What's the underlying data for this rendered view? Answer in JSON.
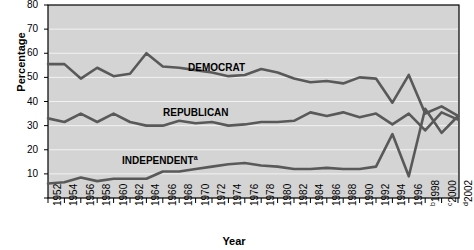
{
  "chart_data": {
    "type": "line",
    "title": "",
    "xlabel": "Year",
    "ylabel": "Percentage",
    "ylim": [
      0,
      80
    ],
    "yticks": [
      0,
      10,
      20,
      30,
      40,
      50,
      60,
      70,
      80
    ],
    "ytick_labels": [
      "",
      "10",
      "20",
      "30",
      "40",
      "50",
      "60",
      "70",
      "80"
    ],
    "grid": "horizontal",
    "legend": "inline-labels",
    "plot_bg": "#d4d4d4",
    "line_color": "#595959",
    "frame_color": "#000000",
    "categories": [
      1952,
      1954,
      1956,
      1958,
      1960,
      1962,
      1964,
      1966,
      1968,
      1970,
      1972,
      1974,
      1976,
      1978,
      1980,
      1982,
      1984,
      1986,
      1988,
      1990,
      1992,
      1994,
      1996,
      1998,
      2000,
      2002
    ],
    "xtick_labels": [
      "1952",
      "1954",
      "1956",
      "1958",
      "1960",
      "1962",
      "1964",
      "1966",
      "1968",
      "1970",
      "1972",
      "1974",
      "1976",
      "1978",
      "1980",
      "1982",
      "1984",
      "1986",
      "1988",
      "1990",
      "1992",
      "1994",
      "1996",
      "1998",
      "2000",
      "2002"
    ],
    "xtick_superscripts": [
      "",
      "",
      "",
      "",
      "",
      "",
      "",
      "",
      "",
      "",
      "",
      "",
      "",
      "",
      "",
      "",
      "",
      "",
      "",
      "",
      "",
      "",
      "",
      "b",
      "c",
      "d"
    ],
    "series": [
      {
        "name": "DEMOCRAT",
        "label": "DEMOCRAT",
        "label_superscript": "",
        "values": [
          55.5,
          55.5,
          49.5,
          54,
          50.5,
          51.5,
          60,
          54.5,
          54,
          53,
          52,
          50.5,
          51,
          53.5,
          52,
          49.5,
          48,
          48.5,
          47.5,
          50,
          49.5,
          39.5,
          51,
          35,
          38,
          34
        ]
      },
      {
        "name": "REPUBLICAN",
        "label": "REPUBLICAN",
        "label_superscript": "",
        "values": [
          33,
          31.5,
          35,
          31.5,
          35,
          31.5,
          30,
          30,
          32,
          31,
          31.5,
          30,
          30.5,
          31.5,
          31.5,
          32,
          35.5,
          34,
          35.5,
          33.5,
          35,
          30.5,
          35,
          28,
          35.5,
          32.5
        ]
      },
      {
        "name": "INDEPENDENT",
        "label": "INDEPENDENT",
        "label_superscript": "a",
        "values": [
          6,
          6.5,
          8.5,
          7,
          8,
          8,
          8,
          11,
          11,
          12,
          13,
          14,
          14.5,
          13.5,
          13,
          12,
          12,
          12.5,
          12,
          12,
          13,
          26.5,
          9,
          37,
          27,
          34
        ]
      }
    ],
    "annotations": {
      "independent_footnote": "a",
      "year_footnotes": [
        "b",
        "c",
        "d"
      ]
    }
  }
}
